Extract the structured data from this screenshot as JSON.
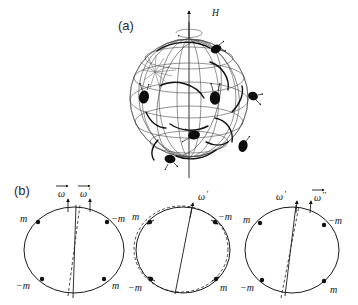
{
  "figure": {
    "background_color": "#ffffff",
    "ink_color": "#111111",
    "grid_color": "#4a4a4a",
    "width": 358,
    "height": 305
  },
  "panels": [
    {
      "id": "panel-a",
      "label": "(a)",
      "label_x": 118,
      "label_y": 30,
      "description": "Rotating sphere with magnetic field axis and particle trajectories",
      "field_label": "H",
      "field_label_x": 212,
      "field_label_y": 16,
      "sphere": {
        "cx": 189,
        "cy": 98,
        "r": 59
      },
      "axis": {
        "x": 189,
        "top_y": 12,
        "bottom_y": 178,
        "arrow_label": "H"
      },
      "particles": [
        {
          "cx": 216,
          "cy": 49,
          "rx": 5.5,
          "ry": 4.2,
          "rot": -25
        },
        {
          "cx": 144,
          "cy": 97,
          "rx": 5.0,
          "ry": 6.5,
          "rot": 10
        },
        {
          "cx": 215,
          "cy": 98,
          "rx": 5.2,
          "ry": 6.8,
          "rot": 0
        },
        {
          "cx": 253,
          "cy": 96,
          "rx": 5.0,
          "ry": 4.2,
          "rot": 20
        },
        {
          "cx": 194,
          "cy": 135,
          "rx": 6.0,
          "ry": 4.5,
          "rot": -10
        },
        {
          "cx": 243,
          "cy": 146,
          "rx": 4.5,
          "ry": 6.0,
          "rot": 15
        },
        {
          "cx": 170,
          "cy": 159,
          "rx": 5.5,
          "ry": 4.2,
          "rot": 10
        }
      ]
    },
    {
      "id": "panel-b",
      "label": "(b)",
      "label_x": 14,
      "label_y": 195,
      "description": "Three circles showing evolution of angular velocity vector",
      "circles": [
        {
          "id": "circle-1",
          "cx": 74,
          "cy": 250,
          "rx": 50,
          "ry": 43,
          "has_dashed_circle": false,
          "axes": [
            {
              "name": "omega-axis",
              "style": "dashed",
              "tilt_deg": -4
            },
            {
              "name": "omega-prime-axis",
              "style": "solid",
              "tilt_deg": 1
            }
          ],
          "vector_labels": [
            {
              "text": "ω",
              "prime": "",
              "x": 63,
              "y": 196
            },
            {
              "text": "ω",
              "prime": "′",
              "x": 88,
              "y": 196
            }
          ],
          "masses": [
            {
              "label": "m",
              "x": 22,
              "y": 219,
              "dot_x": 38,
              "dot_y": 222,
              "arrow": false
            },
            {
              "label": "−m",
              "x": 113,
              "y": 219,
              "dot_x": 107,
              "dot_y": 222,
              "arrow": false
            },
            {
              "label": "−m",
              "x": 18,
              "y": 288,
              "dot_x": 42,
              "dot_y": 279,
              "arrow": false
            },
            {
              "label": "m",
              "x": 114,
              "y": 288,
              "dot_x": 104,
              "dot_y": 279,
              "arrow": false
            }
          ]
        },
        {
          "id": "circle-2",
          "cx": 183,
          "cy": 250,
          "rx": 47,
          "ry": 43,
          "has_dashed_circle": true,
          "axes": [
            {
              "name": "omega-prime-axis",
              "style": "solid",
              "tilt_deg": -10
            }
          ],
          "vector_labels": [
            {
              "text": "ω",
              "prime": "′",
              "x": 200,
              "y": 196
            }
          ],
          "masses": [
            {
              "label": "m",
              "x": 134,
              "y": 217,
              "dot_x": 150,
              "dot_y": 222,
              "arrow": true
            },
            {
              "label": "−m",
              "x": 220,
              "y": 217,
              "dot_x": 215,
              "dot_y": 222,
              "arrow": true
            },
            {
              "label": "−m",
              "x": 130,
              "y": 289,
              "dot_x": 151,
              "dot_y": 279,
              "arrow": true
            },
            {
              "label": "m",
              "x": 222,
              "y": 289,
              "dot_x": 216,
              "dot_y": 279,
              "arrow": true
            }
          ]
        },
        {
          "id": "circle-3",
          "cx": 292,
          "cy": 250,
          "rx": 47,
          "ry": 43,
          "has_dashed_circle": false,
          "axes": [
            {
              "name": "omega-prime-axis",
              "style": "solid",
              "tilt_deg": -6
            },
            {
              "name": "omega-double-prime-axis",
              "style": "dashed",
              "tilt_deg": -10
            }
          ],
          "vector_labels": [
            {
              "text": "ω",
              "prime": "′",
              "x": 282,
              "y": 198
            },
            {
              "text": "ω",
              "prime": "′′",
              "x": 308,
              "y": 198
            }
          ],
          "masses": [
            {
              "label": "m",
              "x": 245,
              "y": 219,
              "dot_x": 260,
              "dot_y": 223,
              "arrow": false
            },
            {
              "label": "−m",
              "x": 329,
              "y": 221,
              "dot_x": 324,
              "dot_y": 225,
              "arrow": false
            },
            {
              "label": "−m",
              "x": 242,
              "y": 289,
              "dot_x": 262,
              "dot_y": 280,
              "arrow": false
            },
            {
              "label": "m",
              "x": 331,
              "y": 292,
              "dot_x": 324,
              "dot_y": 281,
              "arrow": false
            }
          ]
        }
      ]
    }
  ]
}
